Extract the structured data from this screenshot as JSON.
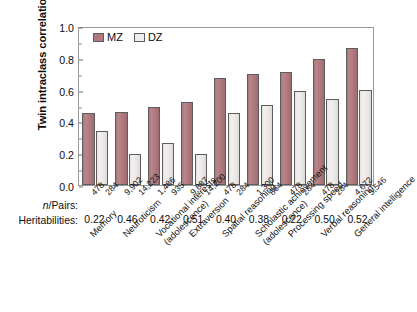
{
  "chart": {
    "type": "bar",
    "ylabel": "Twin intraclass correlations",
    "legend": {
      "position": "top-left-inside",
      "entries": [
        {
          "name": "MZ",
          "color": "#b0797d"
        },
        {
          "name": "DZ",
          "color": "#f0eded"
        }
      ]
    },
    "y_ticks": [
      "0.0",
      "0.2",
      "0.4",
      "0.6",
      "0.8",
      "1.0"
    ],
    "row_labels": {
      "npairs": "n/Pairs:",
      "heritabilities": "Heritabilities:"
    }
  },
  "chart_data": {
    "type": "bar",
    "title": "",
    "xlabel": "",
    "ylabel": "Twin intraclass correlations",
    "ylim": [
      0.0,
      1.0
    ],
    "yticks": [
      0.0,
      0.2,
      0.4,
      0.6,
      0.8,
      1.0
    ],
    "grid": false,
    "legend_position": "upper left (inside axes)",
    "categories": [
      "Memory",
      "Neuroticism",
      "Vocational interests (adolescence)",
      "Extraversion",
      "Spatial reasoning",
      "Scholastic achievement (adolescence)",
      "Processing speed",
      "Verbal reasoning",
      "General intelligence"
    ],
    "series": [
      {
        "name": "MZ",
        "color": "#b0797d",
        "values": [
          0.45,
          0.46,
          0.49,
          0.52,
          0.67,
          0.7,
          0.71,
          0.79,
          0.86
        ]
      },
      {
        "name": "DZ",
        "color": "#f0eded",
        "values": [
          0.34,
          0.195,
          0.265,
          0.195,
          0.455,
          0.505,
          0.59,
          0.54,
          0.6
        ]
      }
    ],
    "annotations": {
      "npairs_row_label": "n/Pairs:",
      "npairs_mz": [
        "478",
        "9,902",
        "1,486",
        "9,887",
        "478",
        "1,300",
        "478",
        "478",
        "4,672"
      ],
      "npairs_dz": [
        "284",
        "14,223",
        "935",
        "14,200",
        "284",
        "864",
        "284",
        "284",
        "5,546"
      ],
      "heritabilities_row_label": "Heritabilities:",
      "heritabilities": [
        0.22,
        0.46,
        0.42,
        0.51,
        0.4,
        0.38,
        0.22,
        0.5,
        0.52
      ]
    }
  }
}
